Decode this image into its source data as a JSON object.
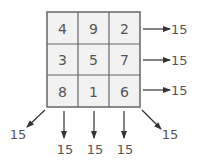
{
  "grid": {
    "rows": [
      [
        "4",
        "9",
        "2"
      ],
      [
        "3",
        "5",
        "7"
      ],
      [
        "8",
        "1",
        "6"
      ]
    ]
  },
  "row_sums": [
    "15",
    "15",
    "15"
  ],
  "column_sums": [
    "15",
    "15",
    "15"
  ],
  "diagonal_sums": {
    "anti_diagonal": "15",
    "main_diagonal": "15"
  },
  "colors": {
    "cell_fill": "#f2f2f2",
    "border": "#666666",
    "text": "#555555",
    "arrow": "#333333"
  }
}
